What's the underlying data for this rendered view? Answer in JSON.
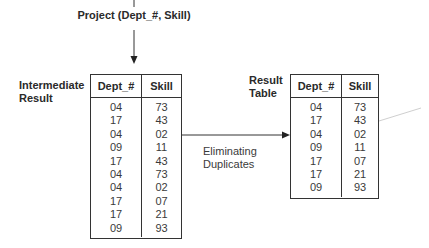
{
  "operation": {
    "label": "Project (Dept_#, Skill)"
  },
  "intermediate": {
    "title_line1": "Intermediate",
    "title_line2": "Result",
    "columns": [
      "Dept_#",
      "Skill"
    ],
    "rows": [
      [
        "04",
        "73"
      ],
      [
        "17",
        "43"
      ],
      [
        "04",
        "02"
      ],
      [
        "09",
        "11"
      ],
      [
        "17",
        "43"
      ],
      [
        "04",
        "73"
      ],
      [
        "04",
        "02"
      ],
      [
        "17",
        "07"
      ],
      [
        "17",
        "21"
      ],
      [
        "09",
        "93"
      ]
    ]
  },
  "transition": {
    "line1": "Eliminating",
    "line2": "Duplicates"
  },
  "result": {
    "title_line1": "Result",
    "title_line2": "Table",
    "columns": [
      "Dept_#",
      "Skill"
    ],
    "rows": [
      [
        "04",
        "73"
      ],
      [
        "17",
        "43"
      ],
      [
        "04",
        "02"
      ],
      [
        "09",
        "11"
      ],
      [
        "17",
        "07"
      ],
      [
        "17",
        "21"
      ],
      [
        "09",
        "93"
      ]
    ]
  },
  "colors": {
    "line": "#333333",
    "faint_line": "#cccccc"
  }
}
